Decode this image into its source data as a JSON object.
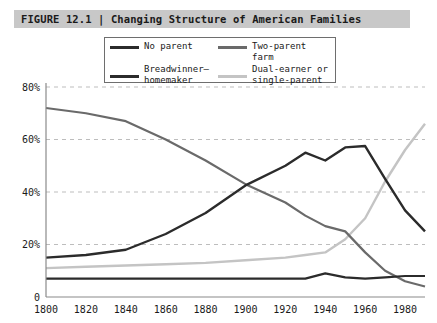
{
  "figure": {
    "label": "FIGURE 12.1",
    "separator": "|",
    "title": "FIGURE 12.1 | Changing Structure of American Families",
    "band_color": "#c8c8c8"
  },
  "legend": {
    "entries": [
      {
        "label": "No parent",
        "color": "#2b2b2b",
        "swatch": "line-swatch"
      },
      {
        "label": "Two-parent farm",
        "color": "#6a6a6a",
        "swatch": "line-swatch"
      },
      {
        "label": "Breadwinner–\nhomemaker",
        "color": "#2b2b2b",
        "swatch": "line-swatch"
      },
      {
        "label": "Dual-earner or\nsingle-parent",
        "color": "#c4c4c4",
        "swatch": "line-swatch"
      }
    ]
  },
  "chart_data": {
    "type": "line",
    "title": "Changing Structure of American Families",
    "xlabel": "",
    "ylabel": "",
    "xlim": [
      1800,
      1990
    ],
    "ylim": [
      0,
      80
    ],
    "grid": true,
    "grid_style": "dashed-horizontal",
    "legend_position": "top-center",
    "x": [
      1800,
      1820,
      1840,
      1860,
      1880,
      1900,
      1920,
      1930,
      1940,
      1950,
      1960,
      1970,
      1980,
      1990
    ],
    "xticks": [
      "1800",
      "1820",
      "1840",
      "1860",
      "1880",
      "1900",
      "1920",
      "1940",
      "1960",
      "1980"
    ],
    "xtick_values": [
      1800,
      1820,
      1840,
      1860,
      1880,
      1900,
      1920,
      1940,
      1960,
      1980
    ],
    "yticks": [
      "0",
      "20%",
      "40%",
      "60%",
      "80%"
    ],
    "ytick_values": [
      0,
      20,
      40,
      60,
      80
    ],
    "series": [
      {
        "name": "No parent",
        "color": "#2b2b2b",
        "width": 2.2,
        "values": [
          7,
          7,
          7,
          7,
          7,
          7,
          7,
          7,
          9,
          7.5,
          7,
          7.5,
          8,
          8
        ]
      },
      {
        "name": "Breadwinner–homemaker",
        "color": "#2b2b2b",
        "width": 2.4,
        "values": [
          15,
          16,
          18,
          24,
          32,
          42.5,
          50,
          55,
          52,
          57,
          57.5,
          45,
          33,
          25
        ]
      },
      {
        "name": "Two-parent farm",
        "color": "#6a6a6a",
        "width": 2.2,
        "values": [
          72,
          70,
          67,
          60,
          52,
          43,
          36,
          31,
          27,
          25,
          17,
          10,
          6,
          4
        ]
      },
      {
        "name": "Dual-earner or single-parent",
        "color": "#c4c4c4",
        "width": 2.4,
        "values": [
          11,
          11.5,
          12,
          12.5,
          13,
          14,
          15,
          16,
          17,
          22,
          30,
          44,
          56,
          66
        ]
      }
    ]
  }
}
